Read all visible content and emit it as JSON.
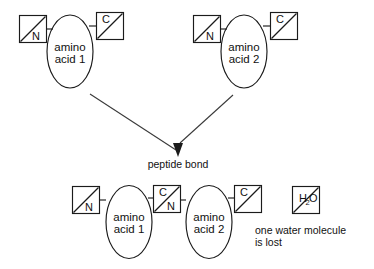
{
  "diagram": {
    "background_color": "#ffffff",
    "ink_color": "#111111",
    "reactants": [
      {
        "name": "amino-acid-1",
        "body_line1": "amino",
        "body_line2": "acid 1",
        "n_terminus_label": "N",
        "c_terminus_label": "C"
      },
      {
        "name": "amino-acid-2",
        "body_line1": "amino",
        "body_line2": "acid 2",
        "n_terminus_label": "N",
        "c_terminus_label": "C"
      }
    ],
    "reaction_label": "peptide bond",
    "products": [
      {
        "name": "amino-acid-1",
        "body_line1": "amino",
        "body_line2": "acid 1",
        "n_terminus_label": "N"
      },
      {
        "name": "amino-acid-2",
        "body_line1": "amino",
        "body_line2": "acid 2",
        "c_terminus_label": "C"
      }
    ],
    "junction": {
      "name": "peptide-bond-junction",
      "c_label": "C",
      "n_label": "N"
    },
    "water": {
      "formula_main": "H",
      "formula_sub": "2",
      "formula_tail": "O",
      "caption_line1": "one water molecule",
      "caption_line2": "is lost"
    }
  }
}
